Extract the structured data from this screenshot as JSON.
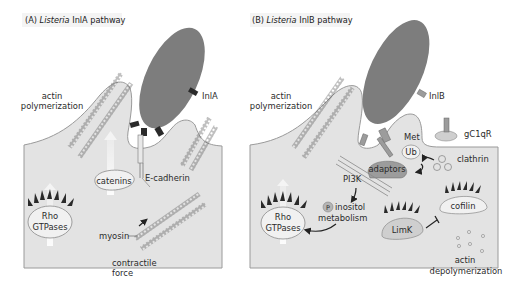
{
  "panel_a": {
    "title_prefix": "(A) ",
    "title_italic": "Listeria",
    "title_suffix": " InlA pathway",
    "labels": {
      "actin_line1": "actin",
      "actin_line2": "polymerization",
      "inla": "InlA",
      "catenins": "catenins",
      "ecadherin": "E-cadherin",
      "rho_line1": "Rho",
      "rho_line2": "GTPases",
      "myosin": "myosin",
      "contractile_line1": "contractile",
      "contractile_line2": "force"
    }
  },
  "panel_b": {
    "title_prefix": "(B) ",
    "title_italic": "Listeria",
    "title_suffix": " InlB pathway",
    "labels": {
      "actin_line1": "actin",
      "actin_line2": "polymerization",
      "inlb": "InlB",
      "gc1qr": "gC1qR",
      "met": "Met",
      "ub": "Ub",
      "adaptors": "adaptors",
      "clathrin": "clathrin",
      "pi3k": "PI3K",
      "p": "P",
      "inositol_line1": "inositol",
      "inositol_line2": "metabolism",
      "rho_line1": "Rho",
      "rho_line2": "GTPases",
      "limk": "LimK",
      "cofilin": "cofilin",
      "depoly_line1": "actin",
      "depoly_line2": "depolymerization"
    }
  },
  "colors": {
    "cell_fill": "#e3e3e3",
    "cell_stroke": "#9a9a9a",
    "bacterium": "#7d7d7d",
    "dark": "#2a2a2a",
    "oval_fill": "#f1f1f1",
    "adaptor_fill": "#9c9c9c",
    "limk_fill": "#cfcfcf"
  }
}
